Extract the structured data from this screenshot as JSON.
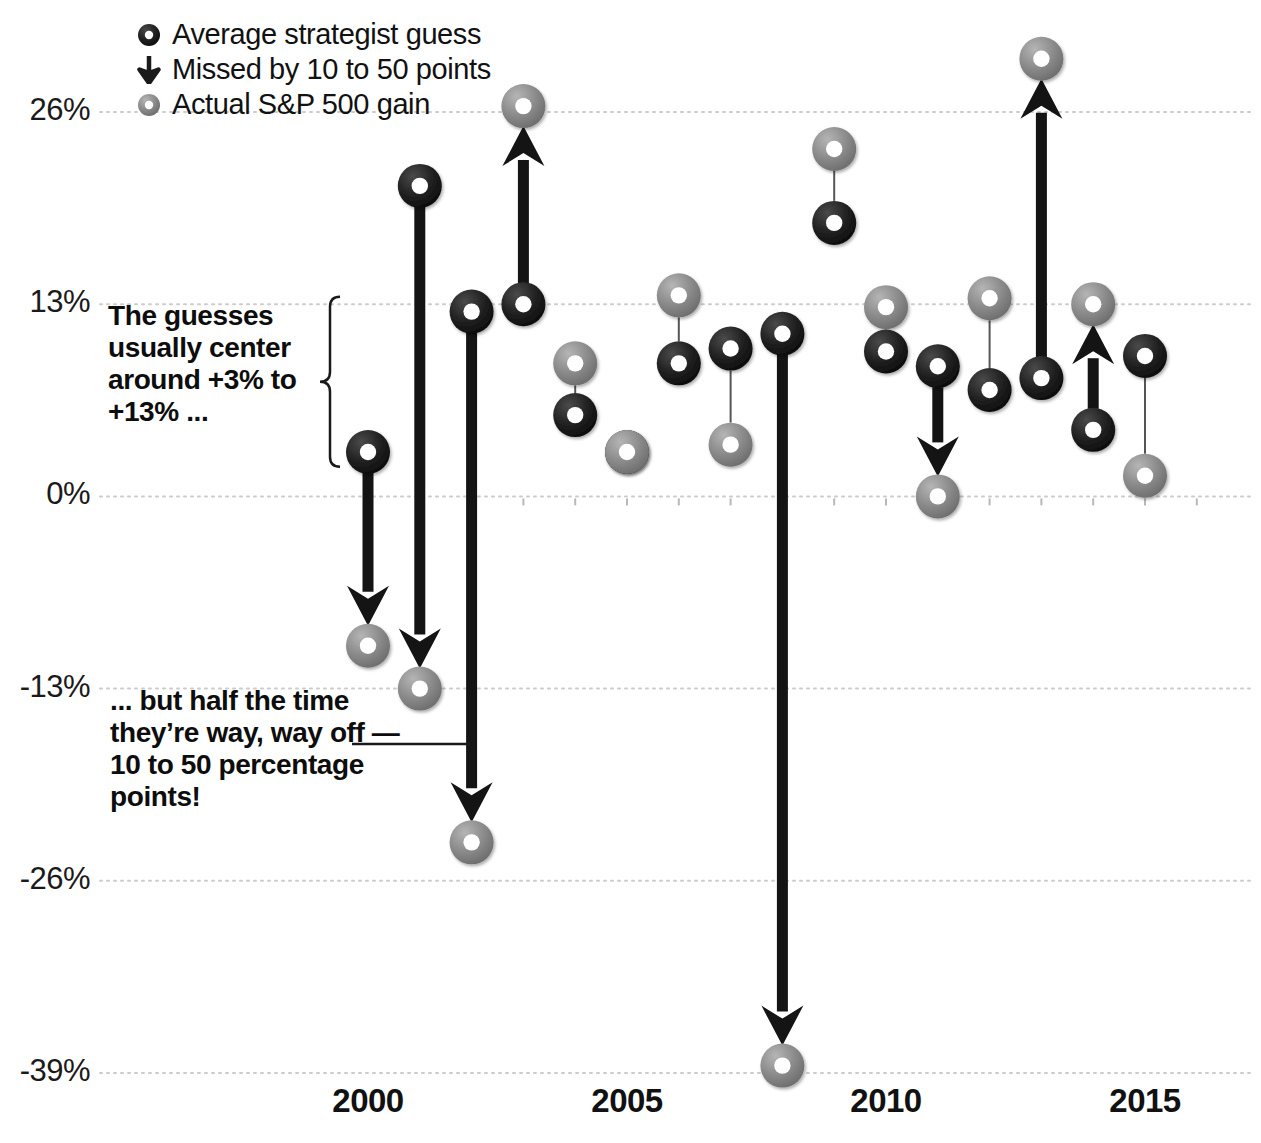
{
  "legend": {
    "items": [
      {
        "icon": "dark-donut-icon",
        "label": "Average strategist guess",
        "color": "#1a1a1a"
      },
      {
        "icon": "down-arrow-icon",
        "label": "Missed by 10 to 50 points",
        "color": "#1a1a1a"
      },
      {
        "icon": "gray-donut-icon",
        "label": "Actual S&P 500 gain",
        "color": "#808080"
      }
    ]
  },
  "annotations": {
    "center": "The guesses usually center around +3% to +13% ...",
    "off": "... but half the time they’re way, way off — 10 to 50 percentage points!"
  },
  "axis": {
    "y_ticks": [
      "26%",
      "13%",
      "0%",
      "-13%",
      "-26%",
      "-39%"
    ],
    "x_ticks": [
      "2000",
      "2005",
      "2010",
      "2015"
    ]
  },
  "colors": {
    "guess": "#1a1a1a",
    "actual": "#8a8a8a",
    "grid": "#cccccc",
    "connector": "#555555",
    "background": "#ffffff"
  },
  "chart_data": {
    "type": "scatter",
    "title": "",
    "xlabel": "",
    "ylabel": "",
    "ylim": [
      -43,
      32
    ],
    "xlim": [
      1999.3,
      2016.7
    ],
    "grid": true,
    "ytick_values": [
      26,
      13,
      0,
      -13,
      -26,
      -39
    ],
    "xtick_values": [
      2000,
      2005,
      2010,
      2015
    ],
    "legend_position": "top-left",
    "series": [
      {
        "name": "Average strategist guess",
        "marker": "dark-donut"
      },
      {
        "name": "Actual S&P 500 gain",
        "marker": "gray-donut"
      }
    ],
    "x": [
      2000,
      2001,
      2002,
      2003,
      2004,
      2005,
      2006,
      2007,
      2008,
      2009,
      2010,
      2011,
      2012,
      2013,
      2014,
      2015,
      2016
    ],
    "points": [
      {
        "year": 2000,
        "guess": 3.0,
        "actual": -10.1,
        "big_miss": true,
        "direction": "down"
      },
      {
        "year": 2001,
        "guess": 21.0,
        "actual": -13.0,
        "big_miss": true,
        "direction": "down"
      },
      {
        "year": 2002,
        "guess": 12.5,
        "actual": -23.4,
        "big_miss": true,
        "direction": "down"
      },
      {
        "year": 2003,
        "guess": 13.0,
        "actual": 26.4,
        "big_miss": true,
        "direction": "up"
      },
      {
        "year": 2004,
        "guess": 5.5,
        "actual": 9.0,
        "big_miss": false,
        "direction": "up"
      },
      {
        "year": 2005,
        "guess": 3.0,
        "actual": 3.0,
        "big_miss": false,
        "direction": "none"
      },
      {
        "year": 2006,
        "guess": 9.0,
        "actual": 13.6,
        "big_miss": false,
        "direction": "up"
      },
      {
        "year": 2007,
        "guess": 10.0,
        "actual": 3.5,
        "big_miss": false,
        "direction": "down"
      },
      {
        "year": 2008,
        "guess": 11.0,
        "actual": -38.5,
        "big_miss": true,
        "direction": "down"
      },
      {
        "year": 2009,
        "guess": 18.5,
        "actual": 23.5,
        "big_miss": false,
        "direction": "up"
      },
      {
        "year": 2010,
        "guess": 9.8,
        "actual": 12.8,
        "big_miss": false,
        "direction": "up"
      },
      {
        "year": 2011,
        "guess": 8.8,
        "actual": 0.0,
        "big_miss": true,
        "direction": "down"
      },
      {
        "year": 2012,
        "guess": 7.2,
        "actual": 13.4,
        "big_miss": false,
        "direction": "up"
      },
      {
        "year": 2013,
        "guess": 8.0,
        "actual": 29.6,
        "big_miss": true,
        "direction": "up"
      },
      {
        "year": 2014,
        "guess": 4.5,
        "actual": 13.0,
        "big_miss": true,
        "direction": "up"
      },
      {
        "year": 2015,
        "guess": 9.5,
        "actual": 1.4,
        "big_miss": false,
        "direction": "down"
      }
    ]
  }
}
